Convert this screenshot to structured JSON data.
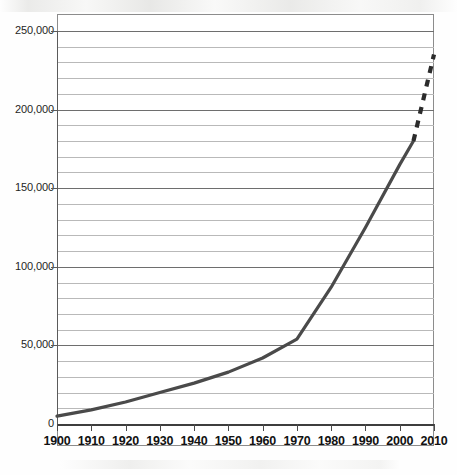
{
  "chart_data": {
    "type": "line",
    "title": "",
    "subtitle": "",
    "xlabel": "",
    "ylabel": "",
    "xlim": [
      1900,
      2010
    ],
    "ylim": [
      0,
      250000
    ],
    "grid": true,
    "legend": null,
    "x_tick_labels": [
      "1900",
      "1910",
      "1920",
      "1930",
      "1940",
      "1950",
      "1960",
      "1970",
      "1980",
      "1990",
      "2000",
      "2010"
    ],
    "x_ticks": [
      1900,
      1910,
      1920,
      1930,
      1940,
      1950,
      1960,
      1970,
      1980,
      1990,
      2000,
      2010
    ],
    "y_tick_labels": [
      "0",
      "50,000",
      "100,000",
      "150,000",
      "200,000",
      "250,000"
    ],
    "y_ticks": [
      0,
      50000,
      100000,
      150000,
      200000,
      250000
    ],
    "y_minor_tick_interval": 10000,
    "series": [
      {
        "name": "observed",
        "style": "solid",
        "color": "#4a4a4a",
        "x": [
          1900,
          1910,
          1920,
          1930,
          1940,
          1950,
          1960,
          1970,
          1980,
          1990,
          2000,
          2004
        ],
        "values": [
          5000,
          9000,
          14000,
          20000,
          26000,
          33000,
          42000,
          54000,
          87000,
          125000,
          165000,
          180000
        ]
      },
      {
        "name": "projected",
        "style": "dashed",
        "color": "#2b2b2b",
        "x": [
          2004,
          2010
        ],
        "values": [
          180000,
          235000
        ]
      }
    ]
  },
  "figure": {
    "background_color": "#ffffff",
    "gridline_color": "#b9b9b9",
    "major_gridline_color": "#6e6e6e",
    "axis_color": "#3d3d3d",
    "frame_color": "#8c8c8c"
  }
}
